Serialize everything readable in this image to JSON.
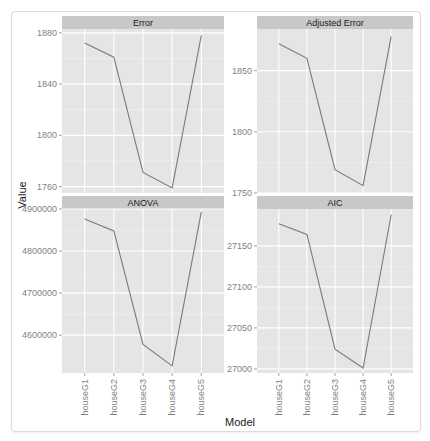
{
  "chart_data": {
    "type": "line",
    "layout": "facet_wrap 2x2, free y scales",
    "xlabel": "Model",
    "ylabel": "Value",
    "categories": [
      "houseG1",
      "houseG2",
      "houseG3",
      "houseG4",
      "houseG5"
    ],
    "grid": true,
    "colors": {
      "panel_bg": "#e5e5e5",
      "strip_bg": "#c8c8c8",
      "grid": "#ffffff",
      "line": "#7a7a7a"
    },
    "panels": [
      {
        "title": "Error",
        "yticks": [
          1760,
          1800,
          1840,
          1880
        ],
        "ylim": [
          1755,
          1883
        ],
        "values": [
          1872,
          1861,
          1771,
          1759,
          1878
        ]
      },
      {
        "title": "Adjusted Error",
        "yticks": [
          1750,
          1800,
          1850
        ],
        "ylim": [
          1750,
          1884
        ],
        "values": [
          1872,
          1860,
          1769,
          1756,
          1878
        ]
      },
      {
        "title": "ANOVA",
        "yticks": [
          4600000,
          4700000,
          4800000,
          4900000
        ],
        "ylim": [
          4510000,
          4900000
        ],
        "values": [
          4876000,
          4848000,
          4578000,
          4527000,
          4893000
        ]
      },
      {
        "title": "AIC",
        "yticks": [
          27000,
          27050,
          27100,
          27150
        ],
        "ylim": [
          26995,
          27195
        ],
        "values": [
          27177,
          27164,
          27024,
          27001,
          27188
        ]
      }
    ]
  }
}
